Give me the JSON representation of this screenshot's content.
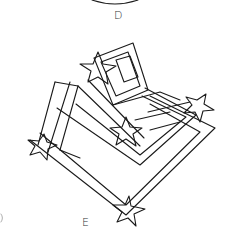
{
  "figure": {
    "labels": {
      "top": "D",
      "bottom": "E"
    },
    "elements": [
      "top-arc",
      "rear-upright-square-frame",
      "inner-window",
      "stacked-diamond-frames",
      "star-top-left",
      "star-center",
      "star-right",
      "star-left",
      "star-bottom"
    ],
    "stroke_color": "#1a1a1a",
    "background": "#ffffff"
  }
}
